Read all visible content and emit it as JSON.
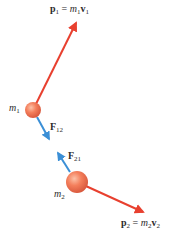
{
  "diagram": {
    "colors": {
      "momentum_arrow": "#e8402f",
      "force_arrow": "#3b8fd6",
      "ball_fill": "#f47f5c",
      "ball_highlight": "#fbb99e",
      "ball_shadow": "#d85a3a",
      "text": "#2b2b2b"
    },
    "labels": {
      "p1": {
        "sym": "p",
        "sub": "1",
        "eq": " = ",
        "m": "m",
        "msub": "1",
        "v": "v",
        "vsub": "1"
      },
      "p2": {
        "sym": "p",
        "sub": "2",
        "eq": " = ",
        "m": "m",
        "msub": "2",
        "v": "v",
        "vsub": "2"
      },
      "m1": {
        "sym": "m",
        "sub": "1"
      },
      "m2": {
        "sym": "m",
        "sub": "2"
      },
      "F12": {
        "sym": "F",
        "sub": "12"
      },
      "F21": {
        "sym": "F",
        "sub": "21"
      }
    },
    "objects": {
      "ball_m1": {
        "cx": 33,
        "cy": 110,
        "r": 8
      },
      "ball_m2": {
        "cx": 77,
        "cy": 182,
        "r": 11
      }
    },
    "arrows": {
      "p1": {
        "from": [
          33,
          110
        ],
        "to": [
          77,
          20
        ]
      },
      "p2": {
        "from": [
          77,
          182
        ],
        "to": [
          146,
          213
        ]
      },
      "F12": {
        "from": [
          36,
          117
        ],
        "to": [
          50,
          141
        ]
      },
      "F21": {
        "from": [
          71,
          172
        ],
        "to": [
          57,
          151
        ]
      }
    }
  }
}
